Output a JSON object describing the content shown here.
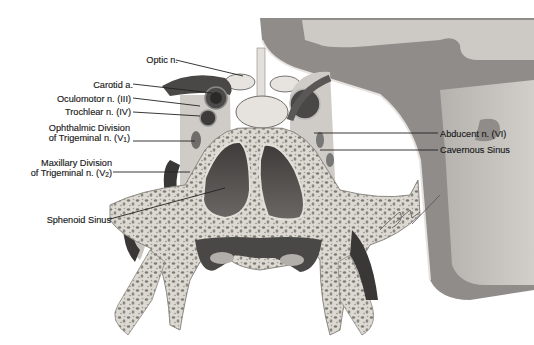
{
  "figure": {
    "colors": {
      "background": "#ffffff",
      "bone_fill": "#d9d6cf",
      "bone_spot": "#7a7670",
      "dura": "#8a8784",
      "brain": "#c9c6c2",
      "vessel_dark": "#3a3836",
      "sinus_cavity": "#555250",
      "label_text": "#1a1a1a"
    },
    "labels": [
      {
        "id": "optic-n",
        "text": "Optic n.",
        "x": 134,
        "y": 55,
        "w": 44,
        "align": "right",
        "line": [
          176,
          60,
          243,
          76
        ]
      },
      {
        "id": "carotid-a",
        "text": "Carotid a.",
        "x": 88,
        "y": 80,
        "w": 45,
        "align": "right",
        "line": [
          133,
          84,
          212,
          93
        ]
      },
      {
        "id": "oculomotor-n",
        "text": "Oculomotor n. (III)",
        "x": 49,
        "y": 94,
        "w": 82,
        "align": "right",
        "line": [
          133,
          98,
          200,
          106
        ]
      },
      {
        "id": "trochlear-n",
        "text": "Trochlear n. (IV)",
        "x": 55,
        "y": 107,
        "w": 76,
        "align": "right",
        "line": [
          133,
          112,
          200,
          116
        ]
      },
      {
        "id": "ophthalmic-division-1",
        "text": "Ophthalmic Division",
        "x": 41,
        "y": 123,
        "w": 89,
        "align": "right"
      },
      {
        "id": "ophthalmic-division-2",
        "text": "of Trigeminal n. (V",
        "sub": "1",
        "suffix": ")",
        "x": 40,
        "y": 133,
        "w": 90,
        "align": "right",
        "line": [
          133,
          141,
          195,
          141
        ]
      },
      {
        "id": "maxillary-division-1",
        "text": "Maxillary Division",
        "x": 34,
        "y": 158,
        "w": 78,
        "align": "right"
      },
      {
        "id": "maxillary-division-2",
        "text": "of Trigeminal n. (V",
        "sub": "2",
        "suffix": ")",
        "x": 23,
        "y": 168,
        "w": 89,
        "align": "right",
        "line": [
          113,
          172,
          190,
          172
        ]
      },
      {
        "id": "sphenoid-sinus",
        "text": "Sphenoid Sinus",
        "x": 39,
        "y": 215,
        "w": 72,
        "align": "right",
        "line": [
          110,
          219,
          225,
          188
        ]
      },
      {
        "id": "abducent-n",
        "text": "Abducent n. (VI)",
        "x": 440,
        "y": 129,
        "w": 80,
        "align": "left",
        "line": [
          314,
          133,
          438,
          133
        ]
      },
      {
        "id": "cavernous-sinus",
        "text": "Cavernous Sinus",
        "x": 440,
        "y": 145,
        "w": 80,
        "align": "left",
        "line": [
          320,
          150,
          438,
          150
        ]
      }
    ],
    "signature": "Peter Jahn"
  }
}
